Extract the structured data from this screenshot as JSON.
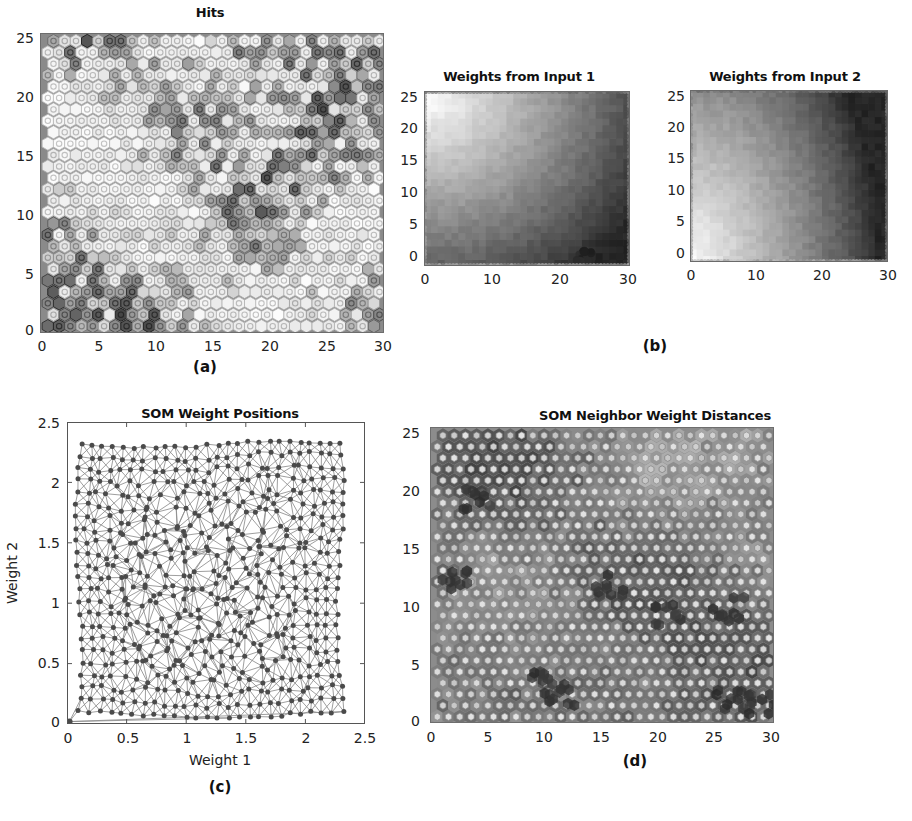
{
  "figure": {
    "kind": "self-organizing-map-diagnostics",
    "panels": [
      "a",
      "b",
      "c",
      "d"
    ]
  },
  "panel_a": {
    "caption": "(a)",
    "title": "Hits",
    "yticks": [
      "25",
      "20",
      "15",
      "10",
      "5",
      "0"
    ],
    "xticks": [
      "0",
      "5",
      "10",
      "15",
      "20",
      "25",
      "30"
    ]
  },
  "panel_b": {
    "caption": "(b)",
    "left": {
      "title": "Weights from Input 1",
      "yticks": [
        "25",
        "20",
        "15",
        "10",
        "5",
        "0"
      ],
      "xticks": [
        "0",
        "10",
        "20",
        "30"
      ]
    },
    "right": {
      "title": "Weights from Input 2",
      "yticks": [
        "25",
        "20",
        "15",
        "10",
        "5",
        "0"
      ],
      "xticks": [
        "0",
        "10",
        "20",
        "30"
      ]
    }
  },
  "panel_c": {
    "caption": "(c)",
    "title": "SOM Weight Positions",
    "xlabel": "Weight 1",
    "ylabel": "Weight 2",
    "yticks": [
      "2.5",
      "2",
      "1.5",
      "1",
      "0.5",
      "0"
    ],
    "xticks": [
      "0",
      "0.5",
      "1",
      "1.5",
      "2",
      "2.5"
    ]
  },
  "panel_d": {
    "caption": "(d)",
    "title": "SOM Neighbor Weight Distances",
    "yticks": [
      "25",
      "20",
      "15",
      "10",
      "5",
      "0"
    ],
    "xticks": [
      "0",
      "5",
      "10",
      "15",
      "20",
      "25",
      "30"
    ]
  },
  "chart_data": [
    {
      "id": "a",
      "type": "heatmap",
      "title": "Hits",
      "xlabel": "",
      "ylabel": "",
      "xlim": [
        -1,
        31
      ],
      "ylim": [
        -1,
        26.5
      ],
      "grid": false,
      "legend": "none",
      "description": "SOM sample-hits plot: 30x26 hexagonal neuron lattice; hexagon fill brightness encodes number of input vectors mapped to each neuron (bright = few hits, dark = many hits).",
      "lattice": {
        "cols": 30,
        "rows": 26,
        "shape": "hexagon"
      },
      "value_range": [
        0,
        1
      ],
      "colors": {
        "background": "#8a8a8a",
        "hex_low": "#f7f7f7",
        "hex_high": "#3c3c3c",
        "edge": "#707070"
      }
    },
    {
      "id": "b-left",
      "type": "heatmap",
      "title": "Weights from Input 1",
      "xlabel": "",
      "ylabel": "",
      "xlim": [
        -1,
        31
      ],
      "ylim": [
        -1,
        26.5
      ],
      "grid": false,
      "legend": "none",
      "description": "SOM weight plane for input 1: weight magnitude increases toward the lower-left of the map (bright) and decreases toward the upper-right (dark).",
      "gradient": {
        "bright_corner": "lower-left",
        "dark_corner": "upper-right"
      },
      "colors": {
        "low": "#2e2e2e",
        "high": "#f2f2f2"
      }
    },
    {
      "id": "b-right",
      "type": "heatmap",
      "title": "Weights from Input 2",
      "xlabel": "",
      "ylabel": "",
      "xlim": [
        -1,
        31
      ],
      "ylim": [
        -1,
        26.5
      ],
      "grid": false,
      "legend": "none",
      "description": "SOM weight plane for input 2: weight magnitude is highest at the upper-left (bright) and lowest toward the lower-right (dark).",
      "gradient": {
        "bright_corner": "upper-left",
        "dark_corner": "lower-right"
      },
      "colors": {
        "low": "#333333",
        "high": "#f4f4f4"
      }
    },
    {
      "id": "c",
      "type": "scatter",
      "title": "SOM Weight Positions",
      "xlabel": "Weight 1",
      "ylabel": "Weight 2",
      "xlim": [
        0,
        2.5
      ],
      "ylim": [
        0,
        2.5
      ],
      "xticks": [
        0,
        0.5,
        1,
        1.5,
        2,
        2.5
      ],
      "yticks": [
        0,
        0.5,
        1,
        1.5,
        2,
        2.5
      ],
      "grid": false,
      "legend": "none",
      "description": "Neuron weight vectors plotted in input space with neighbor connection lines; the 30x26 lattice has unfolded to fill a square region spanning roughly 0.08-2.30 on both weight axes, plus one outlier neuron at the origin.",
      "marker_count": 780,
      "data_span": {
        "x": [
          0.08,
          2.3
        ],
        "y": [
          0.06,
          2.32
        ]
      },
      "outlier_point": [
        0.02,
        0.02
      ],
      "colors": {
        "marker": "#4a4a4a",
        "line": "#6e6e6e",
        "axes": "#555555"
      }
    },
    {
      "id": "d",
      "type": "heatmap",
      "title": "SOM Neighbor Weight Distances",
      "xlabel": "",
      "ylabel": "",
      "xlim": [
        -1,
        31
      ],
      "ylim": [
        -1,
        26.5
      ],
      "grid": false,
      "legend": "none",
      "description": "U-matrix style plot: light hexagons are neurons, the connecting hexagons between them are shaded by the distance between neighboring weight vectors (darker = larger distance).",
      "lattice": {
        "cols": 30,
        "rows": 26,
        "shape": "hexagon"
      },
      "colors": {
        "background": "#8c8c8c",
        "neuron": "#d8d8d8",
        "link_near": "#9a9a9a",
        "link_far": "#3a3a3a"
      }
    }
  ]
}
